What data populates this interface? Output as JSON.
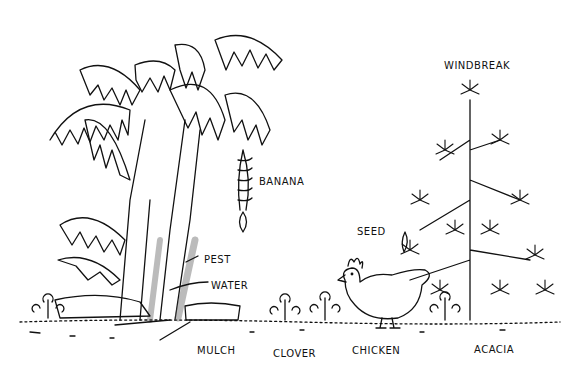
{
  "diagram": {
    "type": "illustrated agroforestry scene",
    "style": "black ink line drawing on white",
    "colors": {
      "ink": "#111111",
      "background": "#ffffff"
    },
    "labels": [
      {
        "id": "windbreak",
        "text": "WINDBREAK",
        "x": 444,
        "y": 60
      },
      {
        "id": "banana",
        "text": "BANANA",
        "x": 259,
        "y": 176
      },
      {
        "id": "seed",
        "text": "SEED",
        "x": 357,
        "y": 226
      },
      {
        "id": "pest",
        "text": "PEST",
        "x": 204,
        "y": 254
      },
      {
        "id": "water",
        "text": "WATER",
        "x": 211,
        "y": 280
      },
      {
        "id": "mulch",
        "text": "MULCH",
        "x": 197,
        "y": 345
      },
      {
        "id": "clover",
        "text": "CLOVER",
        "x": 273,
        "y": 348
      },
      {
        "id": "chicken",
        "text": "CHICKEN",
        "x": 352,
        "y": 345
      },
      {
        "id": "acacia",
        "text": "ACACIA",
        "x": 474,
        "y": 344
      }
    ]
  }
}
